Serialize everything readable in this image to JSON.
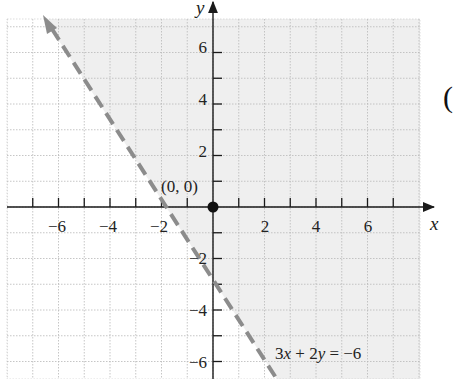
{
  "chart_data": {
    "type": "line",
    "title": "",
    "subtitle": "",
    "xlabel": "x",
    "ylabel": "y",
    "xlim": [
      -8,
      8
    ],
    "ylim": [
      -7,
      7.3
    ],
    "grid": true,
    "x_ticks": [
      -7,
      -6,
      -5,
      -4,
      -3,
      -2,
      -1,
      1,
      2,
      3,
      4,
      5,
      6,
      7
    ],
    "x_tick_labels": [
      "-6",
      "-4",
      "-2",
      "2",
      "4",
      "6"
    ],
    "x_tick_label_values": [
      -6,
      -4,
      -2,
      2,
      4,
      6
    ],
    "y_ticks": [
      -6,
      -5,
      -4,
      -3,
      -2,
      -1,
      1,
      2,
      3,
      4,
      5,
      6
    ],
    "y_tick_labels": [
      "6",
      "4",
      "2",
      "-2",
      "-4",
      "-6"
    ],
    "y_tick_label_values": [
      6,
      4,
      2,
      -2,
      -4,
      -6
    ],
    "series": [
      {
        "name": "3x + 2y = -6",
        "style": "dashed",
        "color": "#8c8c8c",
        "equation": "3x + 2y = -6",
        "slope": -1.5,
        "intercept": -3,
        "points": [
          [
            -6.6,
            6.9
          ],
          [
            -2,
            0
          ],
          [
            0,
            -3
          ],
          [
            2.5,
            -6.75
          ]
        ],
        "arrow_at": "start"
      }
    ],
    "shaded_region": {
      "inequality": "3x + 2y > -6",
      "side": "right/above boundary line",
      "color": "#efefef"
    },
    "test_point": {
      "label": "(0, 0)",
      "x": 0,
      "y": 0
    },
    "annotations": [
      {
        "text": "(0, 0)",
        "x": -0.9,
        "y": 0.5
      },
      {
        "text": "3x + 2y = −6",
        "x": 4.3,
        "y": -6.1
      }
    ]
  },
  "labels": {
    "x_axis": "x",
    "y_axis": "y",
    "origin_point": "(0, 0)",
    "equation": {
      "c1": "3",
      "v1": "x",
      "op1": " + 2",
      "v2": "y",
      "rest": " = −6"
    },
    "x_ticks": [
      "−6",
      "−4",
      "−2",
      "2",
      "4",
      "6"
    ],
    "y_ticks": [
      "6",
      "4",
      "2",
      "−2",
      "−4",
      "−6"
    ],
    "edge_glyph": "("
  },
  "colors": {
    "shade": "#efefef",
    "grid": "#b8b8b8",
    "axis": "#1a1a1a",
    "boundary": "#8c8c8c",
    "point": "#111111"
  }
}
